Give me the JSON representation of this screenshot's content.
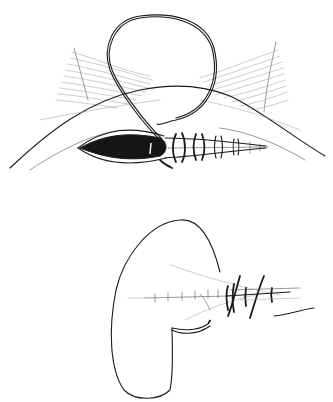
{
  "figure": {
    "description": "Two-panel surgical line illustration of a continuous (running) suture closing an elongated incision",
    "panels": [
      {
        "id": "top",
        "content": "Skin incision with open dark elliptical wound; suture loop above, running sutures closing right half of wound"
      },
      {
        "id": "bottom",
        "content": "Curved tissue edge with suture line; knots on right side and free suture tail"
      }
    ],
    "colors": {
      "background": "#ffffff",
      "ink": "#1a1a1a",
      "wound_fill": "#151515"
    }
  }
}
